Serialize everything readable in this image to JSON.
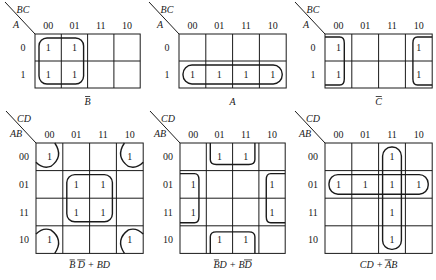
{
  "figure": {
    "background": "#ffffff",
    "ink": "#1a1a1a"
  },
  "maps": [
    {
      "id": "map-b-bar",
      "x": 35,
      "y": 34,
      "cw": 26.3,
      "ch": 27,
      "cols": 4,
      "rows": 2,
      "col_var": "BC",
      "row_var": "A",
      "col_labels": [
        "00",
        "01",
        "11",
        "10"
      ],
      "row_labels": [
        "0",
        "1"
      ],
      "ones": [
        [
          1,
          1,
          0,
          0
        ],
        [
          1,
          1,
          0,
          0
        ]
      ],
      "caption": "B̄",
      "caption_parts": [
        {
          "t": "B",
          "bar": true
        }
      ],
      "loops": [
        {
          "type": "rect",
          "c0": 0,
          "r0": 0,
          "c1": 1,
          "r1": 1,
          "rx": 8
        }
      ]
    },
    {
      "id": "map-a",
      "x": 179,
      "y": 34,
      "cw": 26.8,
      "ch": 27,
      "cols": 4,
      "rows": 2,
      "col_var": "BC",
      "row_var": "A",
      "col_labels": [
        "00",
        "01",
        "11",
        "10"
      ],
      "row_labels": [
        "0",
        "1"
      ],
      "ones": [
        [
          0,
          0,
          0,
          0
        ],
        [
          1,
          1,
          1,
          1
        ]
      ],
      "caption": "A",
      "caption_parts": [
        {
          "t": "A",
          "bar": false
        }
      ],
      "loops": [
        {
          "type": "rect",
          "c0": 0,
          "r0": 1,
          "c1": 3,
          "r1": 1,
          "rx": 9
        }
      ]
    },
    {
      "id": "map-c-bar",
      "x": 325,
      "y": 34,
      "cw": 26.8,
      "ch": 27,
      "cols": 4,
      "rows": 2,
      "col_var": "BC",
      "row_var": "A",
      "col_labels": [
        "00",
        "01",
        "11",
        "10"
      ],
      "row_labels": [
        "0",
        "1"
      ],
      "ones": [
        [
          1,
          0,
          0,
          1
        ],
        [
          1,
          0,
          0,
          1
        ]
      ],
      "caption": "C̄",
      "caption_parts": [
        {
          "t": "C",
          "bar": true
        }
      ],
      "loops": [
        {
          "type": "edge-left",
          "r0": 0,
          "r1": 1
        },
        {
          "type": "edge-right",
          "r0": 0,
          "r1": 1
        }
      ]
    },
    {
      "id": "map-bd-bar-plus-bd",
      "x": 36,
      "y": 143,
      "cw": 26.8,
      "ch": 27.6,
      "cols": 4,
      "rows": 4,
      "col_var": "CD",
      "row_var": "AB",
      "col_labels": [
        "00",
        "01",
        "11",
        "10"
      ],
      "row_labels": [
        "00",
        "01",
        "11",
        "10"
      ],
      "ones": [
        [
          1,
          0,
          0,
          1
        ],
        [
          0,
          1,
          1,
          0
        ],
        [
          0,
          1,
          1,
          0
        ],
        [
          1,
          0,
          0,
          1
        ]
      ],
      "caption": "B̄ D̄ + BD",
      "caption_parts": [
        {
          "t": "B",
          "bar": true
        },
        {
          "t": " "
        },
        {
          "t": "D",
          "bar": true
        },
        {
          "t": " + BD"
        }
      ],
      "loops": [
        {
          "type": "rect",
          "c0": 1,
          "r0": 1,
          "c1": 2,
          "r1": 2,
          "rx": 8
        },
        {
          "type": "corner",
          "corner": "tl"
        },
        {
          "type": "corner",
          "corner": "tr"
        },
        {
          "type": "corner",
          "corner": "bl"
        },
        {
          "type": "corner",
          "corner": "br"
        }
      ]
    },
    {
      "id": "map-b-bar-d-plus-b-d-bar",
      "x": 180,
      "y": 143,
      "cw": 26.3,
      "ch": 27.6,
      "cols": 4,
      "rows": 4,
      "col_var": "CD",
      "row_var": "AB",
      "col_labels": [
        "00",
        "01",
        "11",
        "10"
      ],
      "row_labels": [
        "00",
        "01",
        "11",
        "10"
      ],
      "ones": [
        [
          0,
          1,
          1,
          0
        ],
        [
          1,
          0,
          0,
          1
        ],
        [
          1,
          0,
          0,
          1
        ],
        [
          0,
          1,
          1,
          0
        ]
      ],
      "caption": "B̄D + BD̄",
      "caption_parts": [
        {
          "t": "B",
          "bar": true
        },
        {
          "t": "D + B"
        },
        {
          "t": "D",
          "bar": true
        }
      ],
      "loops": [
        {
          "type": "edge-top",
          "c0": 1,
          "c1": 2
        },
        {
          "type": "edge-bottom",
          "c0": 1,
          "c1": 2
        },
        {
          "type": "edge-left",
          "r0": 1,
          "r1": 2
        },
        {
          "type": "edge-right",
          "r0": 1,
          "r1": 2
        }
      ]
    },
    {
      "id": "map-cd-plus-a-bar-b",
      "x": 325,
      "y": 143,
      "cw": 26.8,
      "ch": 27.6,
      "cols": 4,
      "rows": 4,
      "col_var": "CD",
      "row_var": "AB",
      "col_labels": [
        "00",
        "01",
        "11",
        "10"
      ],
      "row_labels": [
        "00",
        "01",
        "11",
        "10"
      ],
      "ones": [
        [
          0,
          0,
          1,
          0
        ],
        [
          1,
          1,
          1,
          1
        ],
        [
          0,
          0,
          1,
          0
        ],
        [
          0,
          0,
          1,
          0
        ]
      ],
      "caption": "CD + ĀB",
      "caption_parts": [
        {
          "t": "CD + "
        },
        {
          "t": "A",
          "bar": true
        },
        {
          "t": "B"
        }
      ],
      "loops": [
        {
          "type": "rect",
          "c0": 2,
          "r0": 0,
          "c1": 2,
          "r1": 3,
          "rx": 9
        },
        {
          "type": "rect",
          "c0": 0,
          "r0": 1,
          "c1": 3,
          "r1": 1,
          "rx": 9
        }
      ]
    }
  ]
}
